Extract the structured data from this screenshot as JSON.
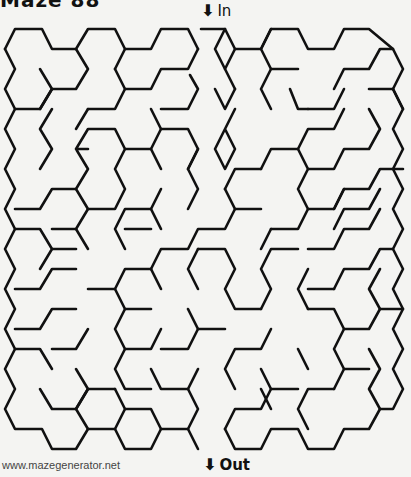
{
  "title": "Maze 88",
  "entrance": {
    "arrow": "⬇",
    "label": "In"
  },
  "exit": {
    "arrow": "⬇",
    "label": "Out"
  },
  "footer": "www.mazegenerator.net",
  "maze": {
    "type": "hexagonal",
    "wall_color": "#111111",
    "walls": [
      [
        [
          5,
          49
        ],
        [
          15,
          29
        ],
        [
          42,
          29
        ],
        [
          52,
          49
        ],
        [
          76,
          49
        ],
        [
          88,
          29
        ],
        [
          115,
          29
        ],
        [
          125,
          49
        ],
        [
          151,
          49
        ],
        [
          161,
          29
        ],
        [
          188,
          29
        ],
        [
          198,
          49
        ]
      ],
      [
        [
          5,
          49
        ],
        [
          15,
          69
        ],
        [
          5,
          89
        ],
        [
          15,
          109
        ],
        [
          5,
          129
        ],
        [
          15,
          149
        ],
        [
          5,
          169
        ],
        [
          15,
          189
        ],
        [
          5,
          209
        ],
        [
          15,
          229
        ],
        [
          5,
          249
        ],
        [
          15,
          269
        ],
        [
          5,
          289
        ],
        [
          15,
          309
        ],
        [
          5,
          329
        ],
        [
          15,
          349
        ],
        [
          5,
          369
        ],
        [
          15,
          389
        ],
        [
          5,
          409
        ],
        [
          15,
          429
        ],
        [
          42,
          429
        ],
        [
          52,
          449
        ],
        [
          76,
          449
        ],
        [
          88,
          429
        ],
        [
          115,
          429
        ],
        [
          125,
          449
        ],
        [
          151,
          449
        ],
        [
          161,
          429
        ],
        [
          188,
          429
        ],
        [
          198,
          449
        ]
      ],
      [
        [
          76,
          49
        ],
        [
          88,
          69
        ],
        [
          76,
          89
        ],
        [
          52,
          89
        ]
      ],
      [
        [
          40,
          69
        ],
        [
          52,
          89
        ],
        [
          40,
          109
        ]
      ],
      [
        [
          115,
          69
        ],
        [
          125,
          49
        ]
      ],
      [
        [
          115,
          69
        ],
        [
          125,
          89
        ],
        [
          151,
          89
        ],
        [
          161,
          69
        ],
        [
          188,
          69
        ],
        [
          198,
          49
        ]
      ],
      [
        [
          88,
          109
        ],
        [
          115,
          109
        ],
        [
          125,
          89
        ]
      ],
      [
        [
          161,
          109
        ],
        [
          188,
          109
        ],
        [
          198,
          89
        ],
        [
          190,
          75
        ]
      ],
      [
        [
          15,
          109
        ],
        [
          40,
          109
        ],
        [
          52,
          89
        ]
      ],
      [
        [
          52,
          109
        ],
        [
          40,
          129
        ],
        [
          52,
          149
        ],
        [
          40,
          169
        ]
      ],
      [
        [
          76,
          129
        ],
        [
          88,
          109
        ]
      ],
      [
        [
          88,
          149
        ],
        [
          76,
          149
        ],
        [
          88,
          129
        ],
        [
          115,
          129
        ],
        [
          125,
          149
        ],
        [
          115,
          169
        ],
        [
          125,
          189
        ],
        [
          115,
          209
        ],
        [
          88,
          209
        ],
        [
          76,
          189
        ],
        [
          88,
          169
        ],
        [
          76,
          149
        ]
      ],
      [
        [
          125,
          149
        ],
        [
          151,
          149
        ],
        [
          161,
          129
        ],
        [
          188,
          129
        ],
        [
          198,
          149
        ],
        [
          188,
          169
        ]
      ],
      [
        [
          161,
          169
        ],
        [
          151,
          149
        ]
      ],
      [
        [
          151,
          109
        ],
        [
          161,
          129
        ]
      ],
      [
        [
          198,
          149
        ],
        [
          188,
          169
        ],
        [
          198,
          189
        ],
        [
          188,
          209
        ]
      ],
      [
        [
          15,
          209
        ],
        [
          40,
          209
        ],
        [
          52,
          189
        ],
        [
          76,
          189
        ]
      ],
      [
        [
          52,
          229
        ],
        [
          76,
          229
        ],
        [
          88,
          209
        ]
      ],
      [
        [
          15,
          229
        ],
        [
          40,
          229
        ],
        [
          52,
          249
        ],
        [
          40,
          269
        ]
      ],
      [
        [
          52,
          249
        ],
        [
          76,
          249
        ]
      ],
      [
        [
          88,
          249
        ],
        [
          76,
          229
        ]
      ],
      [
        [
          125,
          249
        ],
        [
          115,
          229
        ],
        [
          125,
          209
        ],
        [
          151,
          209
        ],
        [
          161,
          189
        ]
      ],
      [
        [
          161,
          229
        ],
        [
          151,
          209
        ]
      ],
      [
        [
          125,
          229
        ],
        [
          151,
          229
        ]
      ],
      [
        [
          151,
          269
        ],
        [
          161,
          249
        ],
        [
          188,
          249
        ],
        [
          198,
          229
        ],
        [
          225,
          229
        ],
        [
          235,
          209
        ],
        [
          261,
          209
        ]
      ],
      [
        [
          161,
          289
        ],
        [
          151,
          269
        ]
      ],
      [
        [
          198,
          289
        ],
        [
          188,
          269
        ],
        [
          198,
          249
        ]
      ],
      [
        [
          198,
          249
        ],
        [
          225,
          249
        ],
        [
          235,
          269
        ],
        [
          225,
          289
        ],
        [
          235,
          309
        ],
        [
          261,
          309
        ]
      ],
      [
        [
          15,
          289
        ],
        [
          40,
          289
        ],
        [
          52,
          269
        ],
        [
          76,
          269
        ]
      ],
      [
        [
          15,
          329
        ],
        [
          40,
          329
        ],
        [
          52,
          309
        ],
        [
          76,
          309
        ]
      ],
      [
        [
          52,
          349
        ],
        [
          76,
          349
        ],
        [
          88,
          329
        ]
      ],
      [
        [
          88,
          289
        ],
        [
          115,
          289
        ],
        [
          125,
          309
        ],
        [
          115,
          329
        ],
        [
          125,
          349
        ],
        [
          151,
          349
        ],
        [
          161,
          329
        ]
      ],
      [
        [
          115,
          289
        ],
        [
          125,
          269
        ],
        [
          151,
          269
        ]
      ],
      [
        [
          125,
          309
        ],
        [
          151,
          309
        ]
      ],
      [
        [
          151,
          389
        ],
        [
          125,
          389
        ],
        [
          115,
          369
        ],
        [
          125,
          349
        ]
      ],
      [
        [
          15,
          349
        ],
        [
          40,
          349
        ],
        [
          52,
          369
        ]
      ],
      [
        [
          40,
          389
        ],
        [
          52,
          409
        ],
        [
          76,
          409
        ],
        [
          88,
          389
        ],
        [
          115,
          389
        ]
      ],
      [
        [
          76,
          369
        ],
        [
          88,
          389
        ],
        [
          76,
          409
        ],
        [
          88,
          429
        ]
      ],
      [
        [
          115,
          389
        ],
        [
          125,
          409
        ],
        [
          115,
          429
        ]
      ],
      [
        [
          125,
          409
        ],
        [
          151,
          409
        ],
        [
          161,
          429
        ]
      ],
      [
        [
          151,
          369
        ],
        [
          161,
          389
        ],
        [
          188,
          389
        ],
        [
          198,
          409
        ],
        [
          188,
          429
        ]
      ],
      [
        [
          198,
          369
        ],
        [
          188,
          389
        ]
      ],
      [
        [
          161,
          349
        ],
        [
          188,
          349
        ],
        [
          198,
          329
        ],
        [
          225,
          329
        ]
      ],
      [
        [
          188,
          309
        ],
        [
          198,
          329
        ]
      ],
      [
        [
          235,
          389
        ],
        [
          225,
          369
        ],
        [
          235,
          349
        ],
        [
          261,
          349
        ],
        [
          271,
          329
        ]
      ],
      [
        [
          225,
          429
        ],
        [
          235,
          409
        ],
        [
          261,
          409
        ],
        [
          271,
          389
        ],
        [
          298,
          389
        ]
      ],
      [
        [
          271,
          409
        ],
        [
          261,
          389
        ]
      ],
      [
        [
          261,
          369
        ],
        [
          271,
          389
        ]
      ],
      [
        [
          225,
          429
        ],
        [
          235,
          449
        ],
        [
          261,
          449
        ],
        [
          271,
          429
        ],
        [
          298,
          429
        ],
        [
          308,
          449
        ],
        [
          334,
          449
        ],
        [
          344,
          429
        ],
        [
          369,
          429
        ],
        [
          380,
          409
        ],
        [
          393,
          409
        ],
        [
          403,
          389
        ],
        [
          393,
          369
        ],
        [
          403,
          349
        ],
        [
          393,
          329
        ],
        [
          403,
          309
        ],
        [
          393,
          289
        ],
        [
          403,
          269
        ],
        [
          393,
          249
        ],
        [
          403,
          229
        ],
        [
          393,
          209
        ],
        [
          403,
          189
        ],
        [
          393,
          169
        ],
        [
          403,
          149
        ],
        [
          393,
          129
        ],
        [
          403,
          109
        ],
        [
          393,
          89
        ],
        [
          403,
          69
        ],
        [
          393,
          49
        ],
        [
          369,
          29
        ],
        [
          344,
          29
        ],
        [
          334,
          49
        ],
        [
          308,
          49
        ],
        [
          298,
          29
        ],
        [
          271,
          29
        ],
        [
          261,
          49
        ],
        [
          235,
          49
        ],
        [
          225,
          29
        ],
        [
          201,
          29
        ]
      ],
      [
        [
          271,
          29
        ],
        [
          261,
          49
        ],
        [
          271,
          69
        ],
        [
          298,
          69
        ]
      ],
      [
        [
          235,
          49
        ],
        [
          225,
          69
        ],
        [
          235,
          89
        ]
      ],
      [
        [
          225,
          69
        ],
        [
          215,
          49
        ],
        [
          225,
          29
        ]
      ],
      [
        [
          215,
          89
        ],
        [
          225,
          109
        ],
        [
          235,
          89
        ]
      ],
      [
        [
          235,
          109
        ],
        [
          225,
          129
        ],
        [
          235,
          149
        ],
        [
          225,
          169
        ],
        [
          215,
          149
        ],
        [
          225,
          129
        ]
      ],
      [
        [
          261,
          89
        ],
        [
          271,
          69
        ],
        [
          261,
          89
        ],
        [
          271,
          109
        ]
      ],
      [
        [
          334,
          89
        ],
        [
          344,
          69
        ],
        [
          369,
          69
        ],
        [
          380,
          49
        ],
        [
          393,
          49
        ]
      ],
      [
        [
          308,
          109
        ],
        [
          334,
          109
        ],
        [
          344,
          89
        ]
      ],
      [
        [
          393,
          89
        ],
        [
          369,
          89
        ]
      ],
      [
        [
          393,
          89
        ],
        [
          403,
          109
        ]
      ],
      [
        [
          290,
          89
        ],
        [
          298,
          109
        ],
        [
          308,
          109
        ]
      ],
      [
        [
          261,
          169
        ],
        [
          271,
          149
        ],
        [
          298,
          149
        ],
        [
          308,
          129
        ],
        [
          334,
          129
        ],
        [
          344,
          109
        ]
      ],
      [
        [
          225,
          189
        ],
        [
          235,
          169
        ],
        [
          261,
          169
        ]
      ],
      [
        [
          225,
          189
        ],
        [
          235,
          209
        ]
      ],
      [
        [
          298,
          149
        ],
        [
          308,
          169
        ],
        [
          298,
          189
        ],
        [
          308,
          209
        ],
        [
          334,
          209
        ],
        [
          344,
          189
        ],
        [
          369,
          189
        ],
        [
          380,
          169
        ],
        [
          403,
          169
        ]
      ],
      [
        [
          308,
          169
        ],
        [
          334,
          169
        ],
        [
          344,
          149
        ],
        [
          369,
          149
        ],
        [
          380,
          129
        ],
        [
          369,
          109
        ]
      ],
      [
        [
          344,
          189
        ],
        [
          334,
          209
        ]
      ],
      [
        [
          271,
          229
        ],
        [
          298,
          229
        ],
        [
          308,
          209
        ]
      ],
      [
        [
          334,
          229
        ],
        [
          344,
          209
        ],
        [
          369,
          209
        ],
        [
          380,
          189
        ]
      ],
      [
        [
          298,
          249
        ],
        [
          271,
          249
        ],
        [
          261,
          269
        ],
        [
          271,
          289
        ],
        [
          261,
          309
        ]
      ],
      [
        [
          261,
          249
        ],
        [
          271,
          229
        ]
      ],
      [
        [
          308,
          249
        ],
        [
          334,
          249
        ],
        [
          344,
          229
        ],
        [
          369,
          229
        ],
        [
          380,
          209
        ]
      ],
      [
        [
          334,
          289
        ],
        [
          344,
          269
        ],
        [
          369,
          269
        ],
        [
          380,
          249
        ],
        [
          393,
          249
        ]
      ],
      [
        [
          308,
          289
        ],
        [
          334,
          289
        ]
      ],
      [
        [
          308,
          309
        ],
        [
          298,
          289
        ],
        [
          308,
          269
        ]
      ],
      [
        [
          308,
          309
        ],
        [
          334,
          309
        ],
        [
          344,
          329
        ],
        [
          369,
          329
        ],
        [
          380,
          309
        ],
        [
          403,
          309
        ]
      ],
      [
        [
          380,
          309
        ],
        [
          369,
          289
        ],
        [
          380,
          269
        ]
      ],
      [
        [
          344,
          329
        ],
        [
          334,
          349
        ],
        [
          344,
          369
        ],
        [
          334,
          389
        ]
      ],
      [
        [
          369,
          369
        ],
        [
          344,
          369
        ]
      ],
      [
        [
          369,
          349
        ],
        [
          380,
          369
        ],
        [
          369,
          389
        ],
        [
          380,
          409
        ]
      ],
      [
        [
          334,
          389
        ],
        [
          308,
          389
        ],
        [
          298,
          409
        ],
        [
          308,
          429
        ]
      ],
      [
        [
          298,
          349
        ],
        [
          308,
          369
        ]
      ]
    ]
  }
}
